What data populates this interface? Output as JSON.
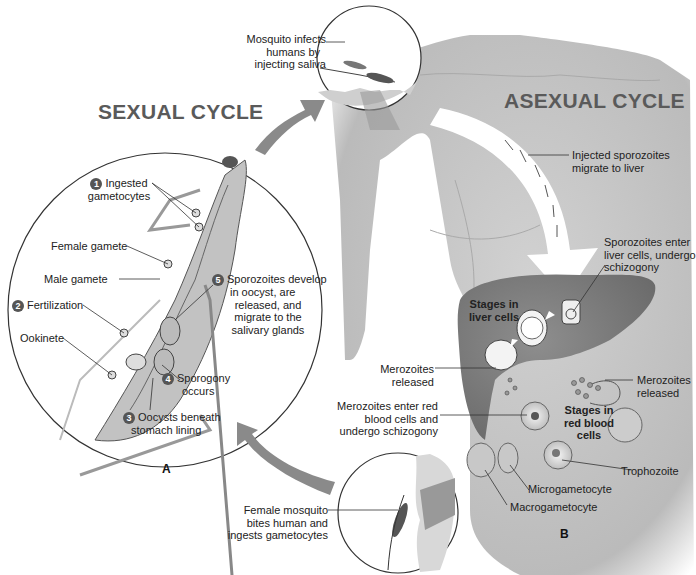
{
  "diagram": {
    "titles": {
      "sexual": "SEXUAL CYCLE",
      "asexual": "ASEXUAL CYCLE"
    },
    "panel_labels": {
      "a": "A",
      "b": "B"
    },
    "colors": {
      "arrow_gray": "#8a8a8a",
      "body_gray": "#bdbdbd",
      "liver_gray": "#7e7e7e",
      "title_gray": "#5a5a5a",
      "num_badge": "#555555"
    },
    "sexual_cycle_steps": [
      {
        "num": "1",
        "line1": "Ingested",
        "line2": "gametocytes"
      },
      {
        "num": "2",
        "line1": "Fertilization"
      },
      {
        "num": "3",
        "line1": "Oocysts beneath",
        "line2": "stomach lining"
      },
      {
        "num": "4",
        "line1": "Sporogony",
        "line2": "occurs"
      },
      {
        "num": "5",
        "line1": "Sporozoites develop",
        "line2": "in oocyst, are",
        "line3": "released, and",
        "line4": "migrate to the",
        "line5": "salivary glands"
      }
    ],
    "sexual_cycle_labels": {
      "female_gamete": "Female gamete",
      "male_gamete": "Male gamete",
      "ookinete": "Ookinete"
    },
    "top_inset": {
      "line1": "Mosquito infects",
      "line2": "humans by",
      "line3": "injecting saliva"
    },
    "bottom_inset": {
      "line1": "Female mosquito",
      "line2": "bites human and",
      "line3": "ingests gametocytes"
    },
    "asexual_labels": {
      "injected": {
        "line1": "Injected sporozoites",
        "line2": "migrate to liver"
      },
      "enter_liver": {
        "line1": "Sporozoites enter",
        "line2": "liver cells, undergo",
        "line3": "schizogony"
      },
      "stages_liver": {
        "line1": "Stages in",
        "line2": "liver cells"
      },
      "merozoites_released_1": {
        "line1": "Merozoites",
        "line2": "released"
      },
      "merozoites_released_2": {
        "line1": "Merozoites",
        "line2": "released"
      },
      "merozoites_enter_rbc": {
        "line1": "Merozoites enter red",
        "line2": "blood cells and",
        "line3": "undergo schizogony"
      },
      "stages_rbc": {
        "line1": "Stages in",
        "line2": "red blood",
        "line3": "cells"
      },
      "trophozoite": "Trophozoite",
      "microgametocyte": "Microgametocyte",
      "macrogametocyte": "Macrogametocyte"
    }
  }
}
